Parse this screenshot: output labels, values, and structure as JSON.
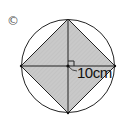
{
  "figure": {
    "label": "©",
    "dimension_text": "10cm",
    "shape": "square-inscribed-in-circle",
    "fill_color": "#c8c8c8",
    "stroke_color": "#222222",
    "right_angle_marker": true
  }
}
